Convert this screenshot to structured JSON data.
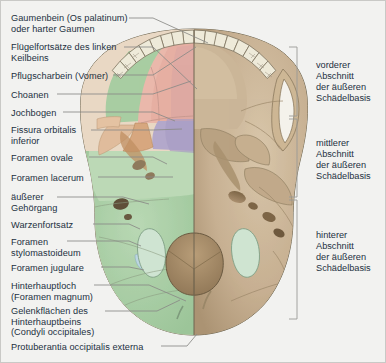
{
  "figure": {
    "title_semantic": "external-skull-base-inferior-view",
    "background_color": "#f2f2f0",
    "border_color": "#c9c9c6",
    "text_color": "#23303f"
  },
  "left_labels": [
    {
      "id": "gaumenbein",
      "lines": [
        "Gaumenbein (Os palatinum)",
        "oder harter Gaumen"
      ],
      "x": 10,
      "y": 12
    },
    {
      "id": "fluegelfortsaetze",
      "lines": [
        "Flügelfortsätze des linken",
        "Keilbeins"
      ],
      "x": 10,
      "y": 41
    },
    {
      "id": "pflugscharbein",
      "lines": [
        "Pflugscharbein (Vomer)"
      ],
      "x": 10,
      "y": 70
    },
    {
      "id": "choanen",
      "lines": [
        "Choanen"
      ],
      "x": 10,
      "y": 89
    },
    {
      "id": "jochbogen",
      "lines": [
        "Jochbogen"
      ],
      "x": 10,
      "y": 107
    },
    {
      "id": "fissura-orbitalis-inferior",
      "lines": [
        "Fissura orbitalis",
        "inferior"
      ],
      "x": 10,
      "y": 124
    },
    {
      "id": "foramen-ovale",
      "lines": [
        "Foramen ovale"
      ],
      "x": 10,
      "y": 152
    },
    {
      "id": "foramen-lacerum",
      "lines": [
        "Foramen lacerum"
      ],
      "x": 10,
      "y": 172
    },
    {
      "id": "aeusserer-gehoergang",
      "lines": [
        "äußerer",
        "Gehörgang"
      ],
      "x": 10,
      "y": 191
    },
    {
      "id": "warzenfortsatz",
      "lines": [
        "Warzenfortsatz"
      ],
      "x": 10,
      "y": 219
    },
    {
      "id": "foramen-stylomastoideum",
      "lines": [
        "Foramen",
        "stylomastoideum"
      ],
      "x": 10,
      "y": 236
    },
    {
      "id": "foramen-jugulare",
      "lines": [
        "Foramen jugulare"
      ],
      "x": 10,
      "y": 262
    },
    {
      "id": "hinterhauptloch",
      "lines": [
        "Hinterhauptloch",
        "(Foramen magnum)"
      ],
      "x": 10,
      "y": 280
    },
    {
      "id": "gelenkflaechen",
      "lines": [
        "Gelenkflächen des",
        "Hinterhauptbeins",
        "(Condyli occipitales)"
      ],
      "x": 10,
      "y": 305
    },
    {
      "id": "protuberantia-occipitalis-externa",
      "lines": [
        "Protuberantia occipitalis externa"
      ],
      "x": 10,
      "y": 341
    }
  ],
  "right_labels": [
    {
      "id": "vorderer-abschnitt",
      "lines": [
        "vorderer",
        "Abschnitt",
        "der äußeren",
        "Schädelbasis"
      ],
      "x": 315,
      "y": 59
    },
    {
      "id": "mittlerer-abschnitt",
      "lines": [
        "mittlerer",
        "Abschnitt",
        "der äußeren",
        "Schädelbasis"
      ],
      "x": 315,
      "y": 137
    },
    {
      "id": "hinterer-abschnitt",
      "lines": [
        "hinterer",
        "Abschnitt",
        "der äußeren",
        "Schädelbasis"
      ],
      "x": 315,
      "y": 229
    }
  ],
  "brackets": [
    {
      "id": "bracket-vorderer",
      "top": 46,
      "bottom": 115,
      "x": 296,
      "tick": 8
    },
    {
      "id": "bracket-mittlerer",
      "top": 118,
      "bottom": 196,
      "x": 296,
      "tick": 8
    },
    {
      "id": "bracket-hinterer",
      "top": 199,
      "bottom": 318,
      "x": 296,
      "tick": 8
    }
  ],
  "colors": {
    "bone_right": "#c3ab8c",
    "bone_right_light": "#d6c4a8",
    "bone_right_dark": "#a68f70",
    "palatine_green": "#a8cda2",
    "maxilla_pink": "#e8b4a8",
    "maxilla_pink_light": "#f0cabf",
    "vomer_rose": "#ddaaa6",
    "sphenoid_purple": "#b0a6c8",
    "pterygoid_tan": "#d9a882",
    "zygomatic_peach": "#e3c0a0",
    "temporal_green": "#b6d5b1",
    "occipital_green": "#a9cfa6",
    "jugular_blue": "#bcd6e2",
    "condyle_mint": "#cfe4d2",
    "teeth_ivory": "#eeead9",
    "outline": "#6b6450",
    "leader": "#8a8a86"
  },
  "leader_lines": [
    {
      "id": "leader-gaumenbein",
      "pts": "128,17 152,17 207,42"
    },
    {
      "id": "leader-fluegelfortsaetze",
      "pts": "123,46 152,46 196,88"
    },
    {
      "id": "leader-pflugscharbein",
      "pts": "112,74 152,74 195,46"
    },
    {
      "id": "leader-choanen",
      "pts": "56,93 152,93 190,80"
    },
    {
      "id": "leader-jochbogen",
      "pts": "62,111 152,111 174,120"
    },
    {
      "id": "leader-fissura",
      "pts": "90,129 152,129 181,128"
    },
    {
      "id": "leader-foramen-ovale",
      "pts": "88,156 152,156 166,163"
    },
    {
      "id": "leader-foramen-lacerum",
      "pts": "97,176 152,176 172,176"
    },
    {
      "id": "leader-aeusserer",
      "pts": "56,196 122,196 148,203"
    },
    {
      "id": "leader-warzenfortsatz",
      "pts": "92,223 128,223 139,228"
    },
    {
      "id": "leader-stylomastoideum",
      "pts": "66,240 128,240 140,245"
    },
    {
      "id": "leader-jugulare",
      "pts": "100,266 128,266 143,269"
    },
    {
      "id": "leader-hinterhauptloch",
      "pts": "93,284 148,284 185,300"
    },
    {
      "id": "leader-gelenkflaechen",
      "pts": "104,310 156,310 179,299"
    },
    {
      "id": "leader-protuberantia",
      "pts": "160,345 186,345 196,333"
    }
  ]
}
